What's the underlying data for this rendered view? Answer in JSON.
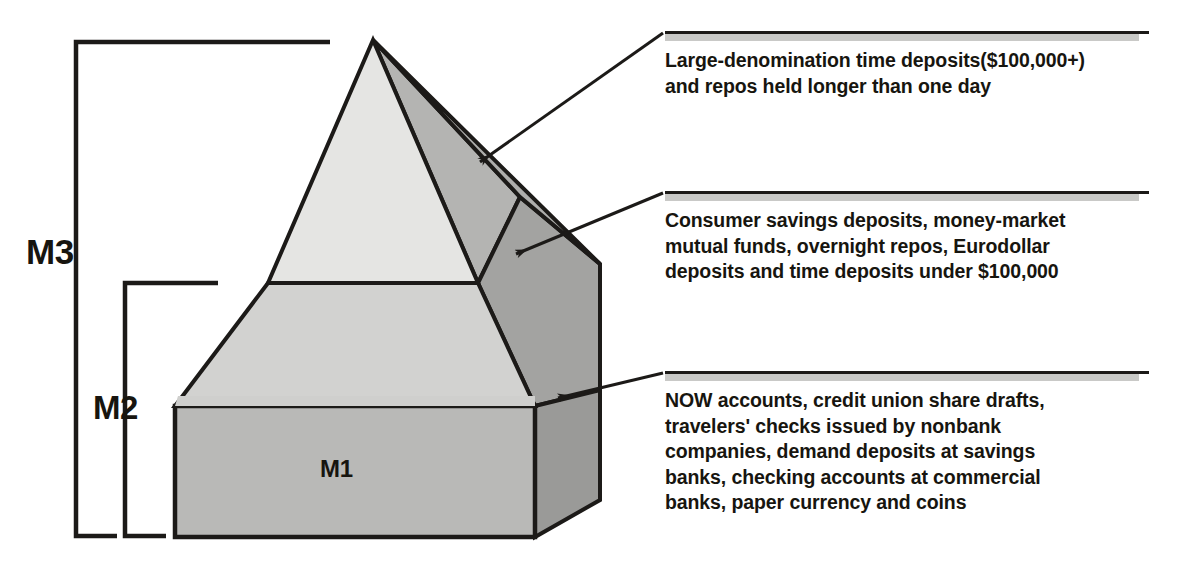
{
  "diagram": {
    "ink_color": "#1c1a18",
    "band_color": "#c9c9c7"
  },
  "pyramid": {
    "tiers": [
      {
        "id": "m3-tier",
        "label": "",
        "face_color": "#e5e5e3",
        "side_color": "#b0b0ae",
        "desc": "top tier of pyramid"
      },
      {
        "id": "m2-tier",
        "label": "",
        "face_color": "#d2d2d0",
        "side_color": "#a2a2a0",
        "desc": "middle tier of pyramid"
      },
      {
        "id": "m1-tier",
        "label": "M1",
        "face_color": "#b9b9b7",
        "side_color": "#9c9c9a",
        "desc": "base block of pyramid"
      }
    ],
    "base_label": "M1"
  },
  "brackets": [
    {
      "id": "m3-bracket",
      "label": "M3"
    },
    {
      "id": "m2-bracket",
      "label": "M2"
    }
  ],
  "callouts": [
    {
      "id": "callout-large-denomination",
      "text": "Large-denomination time deposits($100,000+)\nand repos held longer than one day"
    },
    {
      "id": "callout-consumer-savings",
      "text": "Consumer savings deposits, money-market\nmutual funds, overnight repos, Eurodollar\ndeposits and time deposits under $100,000"
    },
    {
      "id": "callout-now-accounts",
      "text": "NOW accounts, credit union share drafts,\ntravelers' checks issued by nonbank\ncompanies, demand deposits at savings\nbanks, checking accounts at commercial\nbanks, paper currency and coins"
    }
  ]
}
